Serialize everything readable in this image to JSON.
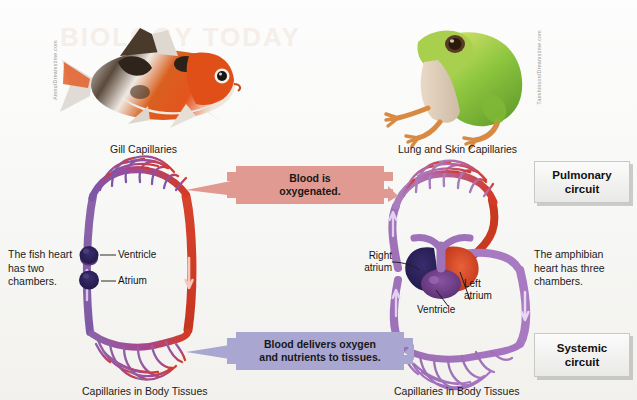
{
  "figure": {
    "type": "biology-diagram",
    "ghost_watermark": "BIOLOGY TODAY"
  },
  "photos": [
    {
      "name": "fish-photo",
      "alt": "Orange white and black goldfish",
      "credit": "Amnu/Dreamstime.com"
    },
    {
      "name": "frog-photo",
      "alt": "Green tree frog",
      "credit": "Taeshinson/Dreamstime.com"
    }
  ],
  "captions": {
    "gill_capillaries": "Gill Capillaries",
    "lung_skin_capillaries": "Lung and Skin Capillaries",
    "body_capillaries_left": "Capillaries in Body Tissues",
    "body_capillaries_right": "Capillaries in Body Tissues"
  },
  "side_notes": {
    "fish_heart": "The fish heart\nhas two\nchambers.",
    "fish_heart_line1": "The fish heart",
    "fish_heart_line2": "has two",
    "fish_heart_line3": "chambers.",
    "amphibian_heart_line1": "The amphibian",
    "amphibian_heart_line2": "heart has three",
    "amphibian_heart_line3": "chambers."
  },
  "heart_labels": {
    "fish_ventricle": "Ventricle",
    "fish_atrium": "Atrium",
    "right_atrium_line1": "Right",
    "right_atrium_line2": "atrium",
    "ventricle": "Ventricle",
    "left_atrium_line1": "Left",
    "left_atrium_line2": "atrium"
  },
  "callouts": [
    {
      "name": "oxygenated-callout",
      "line1": "Blood is",
      "line2": "oxygenated.",
      "color": "#e09a92"
    },
    {
      "name": "delivery-callout",
      "line1": "Blood delivers oxygen",
      "line2": "and nutrients to tissues.",
      "color": "#a9a7d2"
    }
  ],
  "circuit_boxes": [
    {
      "name": "pulmonary-circuit-box",
      "line1": "Pulmonary",
      "line2": "circuit"
    },
    {
      "name": "systemic-circuit-box",
      "line1": "Systemic",
      "line2": "circuit"
    }
  ],
  "colors": {
    "oxygenated_red": "#d43a24",
    "deoxygenated_purple": "#8b63a8",
    "mixed_violet": "#9a6bb5",
    "dark_navy_atrium": "#241d52",
    "ventricle_purple": "#6e3c86",
    "callout_red": "#e09a92",
    "callout_blue": "#a9a7d2",
    "arrow_light": "#f2d9e8"
  }
}
